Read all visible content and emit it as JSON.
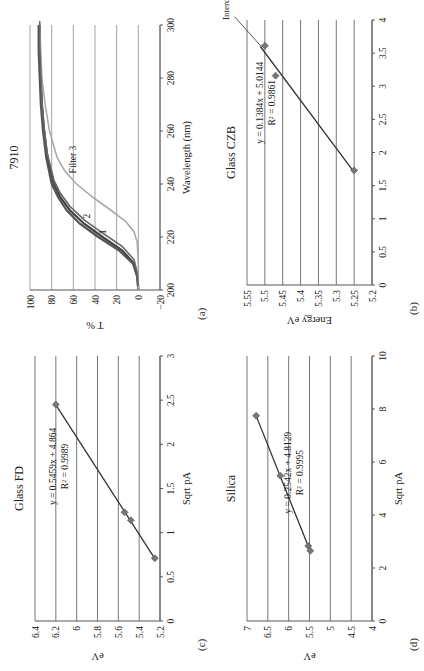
{
  "panels": {
    "a": {
      "label": "(a)"
    },
    "b": {
      "label": "(b)"
    },
    "c": {
      "label": "(c)"
    },
    "d": {
      "label": "(d)"
    }
  },
  "chart_data": [
    {
      "id": "a",
      "type": "line",
      "title": "7910",
      "xlabel": "Wavelength (nm)",
      "ylabel": "T %",
      "xlim": [
        200,
        300
      ],
      "ylim": [
        -20,
        100
      ],
      "xticks": [
        "200",
        "220",
        "240",
        "260",
        "280",
        "300"
      ],
      "yticks": [
        "-20",
        "0",
        "20",
        "40",
        "60",
        "80",
        "100"
      ],
      "grid": true,
      "series": [
        {
          "name": "1",
          "color": "#444444",
          "x": [
            200,
            205,
            210,
            215,
            220,
            225,
            230,
            235,
            240,
            250,
            260,
            270,
            280,
            290,
            300
          ],
          "values": [
            0,
            1,
            4,
            15,
            33,
            50,
            63,
            72,
            78,
            84,
            87,
            89,
            90,
            91,
            91
          ]
        },
        {
          "name": "2",
          "color": "#555555",
          "x": [
            200,
            205,
            210,
            215,
            220,
            225,
            230,
            235,
            240,
            250,
            260,
            270,
            280,
            290,
            300
          ],
          "values": [
            0,
            1,
            5,
            18,
            37,
            54,
            66,
            74,
            80,
            85,
            88,
            90,
            91,
            92,
            92
          ]
        },
        {
          "name": "Filter 3",
          "color": "#aaaaaa",
          "x": [
            200,
            210,
            218,
            222,
            226,
            230,
            235,
            240,
            245,
            250,
            260,
            270,
            280,
            290,
            300
          ],
          "values": [
            0,
            0,
            1,
            4,
            12,
            25,
            42,
            57,
            68,
            75,
            82,
            86,
            89,
            90,
            91
          ]
        }
      ],
      "annotations": [
        "1",
        "2",
        "Filter 3"
      ]
    },
    {
      "id": "b",
      "type": "scatter",
      "title": "Glass CZB",
      "xlabel": "",
      "ylabel": "Energy eV",
      "xlim": [
        0,
        4
      ],
      "ylim": [
        5.2,
        5.55
      ],
      "xticks": [
        "0",
        "0.5",
        "1",
        "1.5",
        "2",
        "2.5",
        "3",
        "3.5",
        "4"
      ],
      "yticks": [
        "5.2",
        "5.25",
        "5.3",
        "5.35",
        "5.4",
        "5.45",
        "5.5",
        "5.55"
      ],
      "grid": true,
      "points": [
        {
          "x": 1.73,
          "y": 5.25
        },
        {
          "x": 3.16,
          "y": 5.47
        },
        {
          "x": 3.61,
          "y": 5.5
        }
      ],
      "trendline": {
        "equation": "y = 0.1384x + 5.0144",
        "r2": "R² = 0.9861",
        "x0": 1.73,
        "x1": 3.6
      },
      "annotations": [
        "Intercept"
      ]
    },
    {
      "id": "c",
      "type": "scatter",
      "title": "Glass FD",
      "xlabel": "Sqrt pA",
      "ylabel": "eV",
      "xlim": [
        0,
        3
      ],
      "ylim": [
        5.2,
        6.4
      ],
      "xticks": [
        "0",
        "0.5",
        "1",
        "1.5",
        "2",
        "2.5",
        "3"
      ],
      "yticks": [
        "5.2",
        "5.4",
        "5.6",
        "5.8",
        "6",
        "6.2",
        "6.4"
      ],
      "grid": true,
      "points": [
        {
          "x": 0.71,
          "y": 5.25
        },
        {
          "x": 1.14,
          "y": 5.48
        },
        {
          "x": 1.23,
          "y": 5.54
        },
        {
          "x": 2.45,
          "y": 6.2
        }
      ],
      "trendline": {
        "equation": "y = 0.5459x + 4.864",
        "r2": "R² = 0.9989",
        "x0": 0.71,
        "x1": 2.45
      }
    },
    {
      "id": "d",
      "type": "scatter",
      "title": "Silica",
      "xlabel": "Sqrt pA",
      "ylabel": "eV",
      "xlim": [
        0,
        10
      ],
      "ylim": [
        4,
        7
      ],
      "xticks": [
        "0",
        "2",
        "4",
        "6",
        "8",
        "10"
      ],
      "yticks": [
        "4",
        "4.5",
        "5",
        "5.5",
        "6",
        "6.5",
        "7"
      ],
      "grid": true,
      "points": [
        {
          "x": 2.65,
          "y": 5.48
        },
        {
          "x": 2.83,
          "y": 5.53
        },
        {
          "x": 5.48,
          "y": 6.2
        },
        {
          "x": 7.75,
          "y": 6.78
        }
      ],
      "trendline": {
        "equation": "y = 0.2542x + 4.8129",
        "r2": "R² = 0.9995",
        "x0": 2.65,
        "x1": 7.75
      }
    }
  ]
}
